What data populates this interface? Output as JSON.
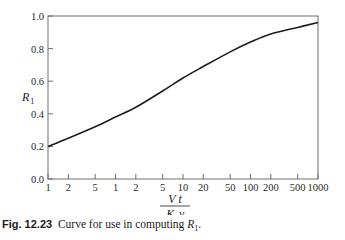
{
  "chart_data": {
    "type": "line",
    "title": "",
    "caption": {
      "figure_number": "Fig. 12.23",
      "text": "Curve for use in computing",
      "symbol": "R",
      "symbol_sub": "1",
      "end": "."
    },
    "xlabel": {
      "numerator": "V t",
      "denominator_main": "K",
      "denominator_sub": "1",
      "denominator_tail": "γ"
    },
    "ylabel": {
      "main": "R",
      "sub": "1"
    },
    "xscale": "log",
    "x_tick_labels": [
      "1",
      "2",
      "5",
      "1",
      "2",
      "5",
      "10",
      "20",
      "50",
      "100",
      "200",
      "500",
      "1000"
    ],
    "x_tick_values": [
      0.01,
      0.02,
      0.05,
      0.1,
      0.2,
      0.5,
      1,
      2,
      5,
      10,
      20,
      50,
      100
    ],
    "y_tick_labels": [
      "0.0",
      "0.2",
      "0.4",
      "0.6",
      "0.8",
      "1.0"
    ],
    "ylim": [
      0.0,
      1.0
    ],
    "grid": false,
    "legend": null,
    "series": [
      {
        "name": "R1",
        "x_label_positions": [
          "1",
          "2",
          "5",
          "1",
          "2",
          "5",
          "10",
          "20",
          "50",
          "100",
          "200",
          "500",
          "1000"
        ],
        "values": [
          0.2,
          0.25,
          0.32,
          0.38,
          0.44,
          0.54,
          0.62,
          0.69,
          0.78,
          0.84,
          0.89,
          0.93,
          0.96
        ]
      }
    ]
  }
}
